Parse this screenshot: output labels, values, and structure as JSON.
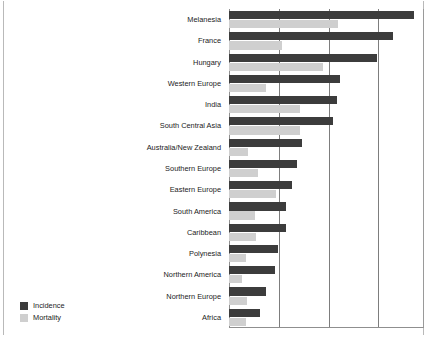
{
  "chart_data": {
    "type": "bar",
    "orientation": "horizontal",
    "title": "",
    "xlabel": "",
    "ylabel": "",
    "grid": true,
    "gridlines_x": [
      1,
      2,
      3
    ],
    "xlim": [
      0,
      3.95
    ],
    "legend_position": "bottom-left",
    "categories": [
      "Melanesia",
      "France",
      "Hungary",
      "Western Europe",
      "India",
      "South Central Asia",
      "Australia/New Zealand",
      "Southern Europe",
      "Eastern Europe",
      "South America",
      "Caribbean",
      "Polynesia",
      "Northern America",
      "Northern Europe",
      "Africa"
    ],
    "series": [
      {
        "name": "Incidence",
        "color": "#3c3c3c",
        "values": [
          3.75,
          3.33,
          3.0,
          2.25,
          2.19,
          2.11,
          1.48,
          1.38,
          1.28,
          1.16,
          1.16,
          0.99,
          0.93,
          0.75,
          0.63
        ]
      },
      {
        "name": "Mortality",
        "color": "#cfcfcf",
        "values": [
          2.21,
          1.08,
          1.91,
          0.75,
          1.44,
          1.44,
          0.39,
          0.59,
          0.95,
          0.53,
          0.55,
          0.35,
          0.26,
          0.37,
          0.35
        ]
      }
    ]
  },
  "legend": {
    "items": [
      {
        "label": "Incidence",
        "color": "#3c3c3c"
      },
      {
        "label": "Mortality",
        "color": "#cfcfcf"
      }
    ]
  }
}
